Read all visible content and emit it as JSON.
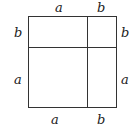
{
  "diagram": {
    "type": "square-decomposition",
    "labels": {
      "top_left": "a",
      "top_right": "b",
      "left_top": "b",
      "left_bottom": "a",
      "right_top": "b",
      "right_bottom": "a",
      "bottom_left": "a",
      "bottom_right": "b"
    },
    "line_color": "#333333"
  }
}
